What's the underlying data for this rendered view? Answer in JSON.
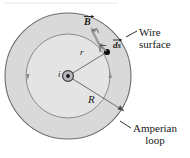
{
  "figure": {
    "type": "physics-diagram",
    "topic": "Ampere's law for a current-carrying wire",
    "labels": {
      "wire_surface_line1": "Wire",
      "wire_surface_line2": "surface",
      "amperian_line1": "Amperian",
      "amperian_line2": "loop",
      "b_field": "B",
      "ds_element": "ds",
      "radius_r": "r",
      "radius_R": "R",
      "current": "i"
    },
    "colors": {
      "wire_fill": "#d9d9d9",
      "loop_fill": "#e4e4e4",
      "outline": "#6e6e72",
      "vector": "#8c8c90",
      "text": "#1a1a1a",
      "background": "#ffffff"
    },
    "geometry": {
      "center_x": 68,
      "center_y": 76,
      "wire_radius": 63,
      "loop_radius": 42,
      "ds_point_x": 107,
      "ds_point_y": 52
    }
  }
}
